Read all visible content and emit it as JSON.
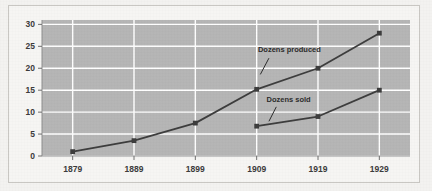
{
  "figure": {
    "name": "dozens-produced-vs-sold-line-chart",
    "background_color": "#f3f2f0",
    "frame_border_color": "#c9c7c3"
  },
  "chart_data": {
    "type": "line",
    "title": "",
    "xlabel": "",
    "ylabel": "",
    "categories": [
      "1879",
      "1889",
      "1899",
      "1909",
      "1919",
      "1929"
    ],
    "x": [
      1879,
      1889,
      1899,
      1909,
      1919,
      1929
    ],
    "xlim": [
      1874,
      1934
    ],
    "ylim": [
      0,
      31
    ],
    "yticks": [
      0,
      5,
      10,
      15,
      20,
      25,
      30
    ],
    "ytick_labels": [
      "0",
      "5",
      "10",
      "15",
      "20",
      "25",
      "30"
    ],
    "grid": true,
    "grid_color": "#ffffff",
    "plot_background": "#b5b5b5",
    "legend": "none",
    "series": [
      {
        "name": "Dozens produced",
        "color": "#3c3c3c",
        "marker": "square",
        "values": [
          1,
          3.5,
          7.5,
          15.2,
          20,
          28
        ],
        "x": [
          1879,
          1889,
          1899,
          1909,
          1919,
          1929
        ]
      },
      {
        "name": "Dozens sold",
        "color": "#3c3c3c",
        "marker": "square",
        "values": [
          6.8,
          9,
          15
        ],
        "x": [
          1909,
          1919,
          1929
        ]
      }
    ],
    "annotations": [
      {
        "text": "Dozens produced",
        "label_x": 1909.2,
        "label_y": 23.6,
        "leader_from_x": 1911.0,
        "leader_from_y": 22.3,
        "leader_to_x": 1909.6,
        "leader_to_y": 18.6
      },
      {
        "text": "Dozens sold",
        "label_x": 1910.6,
        "label_y": 12.4,
        "leader_from_x": 1912.2,
        "leader_from_y": 11.2,
        "leader_to_x": 1911.0,
        "leader_to_y": 7.9
      }
    ]
  }
}
